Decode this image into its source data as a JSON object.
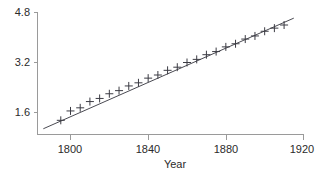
{
  "chart_data": {
    "type": "scatter",
    "title": "",
    "xlabel": "Year",
    "ylabel": "",
    "xlim": [
      1784,
      1920
    ],
    "ylim": [
      1.0,
      5.0
    ],
    "grid": false,
    "legend": null,
    "x": [
      1795,
      1800,
      1805,
      1810,
      1815,
      1820,
      1825,
      1830,
      1835,
      1840,
      1845,
      1850,
      1855,
      1860,
      1865,
      1870,
      1875,
      1880,
      1885,
      1890,
      1895,
      1900,
      1905,
      1910
    ],
    "y": [
      1.35,
      1.65,
      1.75,
      1.95,
      2.05,
      2.2,
      2.3,
      2.45,
      2.55,
      2.7,
      2.8,
      2.95,
      3.05,
      3.2,
      3.3,
      3.45,
      3.55,
      3.7,
      3.8,
      3.95,
      4.05,
      4.2,
      4.3,
      4.4
    ],
    "marker": "plus",
    "series": [
      {
        "name": "observations",
        "type": "scatter",
        "values": [
          1.35,
          1.65,
          1.75,
          1.95,
          2.05,
          2.2,
          2.3,
          2.45,
          2.55,
          2.7,
          2.8,
          2.95,
          3.05,
          3.2,
          3.3,
          3.45,
          3.55,
          3.7,
          3.8,
          3.95,
          4.05,
          4.2,
          4.3,
          4.4
        ]
      },
      {
        "name": "fitted-trend-line",
        "type": "line",
        "x": [
          1786,
          1915
        ],
        "y": [
          1.08,
          4.62
        ]
      }
    ],
    "xticks": [
      1800,
      1840,
      1880,
      1920
    ],
    "xticklabels": [
      "1800",
      "1840",
      "1880",
      "1920"
    ],
    "yticks": [
      1.6,
      3.2,
      4.8
    ],
    "yticklabels": [
      "1.6",
      "3.2",
      "4.8"
    ]
  },
  "axes": {
    "x_title": "Year",
    "y_title": "",
    "x_tick_labels": [
      "1800",
      "1840",
      "1880",
      "1920"
    ],
    "y_tick_labels": [
      "4.8",
      "3.2",
      "1.6"
    ]
  },
  "colors": {
    "background": "#ffffff",
    "axis": "#9a9a9a",
    "text": "#2b2b2b",
    "line": "#4a4a52",
    "marker": "#3c3c44"
  }
}
